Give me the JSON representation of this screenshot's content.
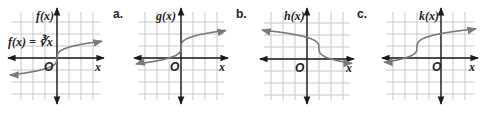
{
  "graphs": [
    {
      "id": "f",
      "panel_label": "",
      "function_label": "f(x)",
      "equation_label": "f(x) = ∛x",
      "x_axis_label": "x",
      "origin_label": "O",
      "transform": {
        "h": 0,
        "k": 0,
        "reflect": false
      },
      "curve_color": "#7a7a7a"
    },
    {
      "id": "g",
      "panel_label": "a.",
      "function_label": "g(x)",
      "x_axis_label": "x",
      "origin_label": "O",
      "transform": {
        "h": 0,
        "k": 1,
        "reflect": false
      },
      "curve_color": "#7a7a7a"
    },
    {
      "id": "h",
      "panel_label": "b.",
      "function_label": "h(x)",
      "x_axis_label": "x",
      "origin_label": "O",
      "transform": {
        "h": 1,
        "k": 1,
        "reflect": true
      },
      "curve_color": "#7a7a7a"
    },
    {
      "id": "k",
      "panel_label": "c.",
      "function_label": "k(x)",
      "x_axis_label": "x",
      "origin_label": "O",
      "transform": {
        "h": -2,
        "k": 1,
        "reflect": false
      },
      "curve_color": "#7a7a7a"
    }
  ],
  "colors": {
    "grid": "#c8c8c8",
    "axis": "#1a1a1a",
    "curve": "#7a7a7a",
    "text": "#222222"
  }
}
